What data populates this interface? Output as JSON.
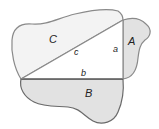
{
  "diagram": {
    "type": "pythagorean-areas",
    "regions": {
      "C": {
        "label": "C",
        "fill": "#f3f3f3"
      },
      "A": {
        "label": "A",
        "fill": "#e2e2e2"
      },
      "B": {
        "label": "B",
        "fill": "#e2e2e2"
      }
    },
    "sides": {
      "a": {
        "label": "a"
      },
      "b": {
        "label": "b"
      },
      "c": {
        "label": "c"
      }
    },
    "colors": {
      "outline": "#8a8a8a",
      "triangle": "#555555",
      "background": "#ffffff"
    }
  }
}
